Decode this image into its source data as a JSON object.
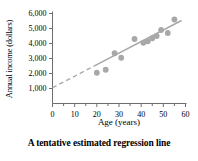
{
  "chart_data": {
    "type": "scatter",
    "title": "",
    "caption": "A tentative estimated regression line",
    "xlabel": "Age (years)",
    "ylabel": "Annual income (dollars)",
    "xlim": [
      0,
      60
    ],
    "ylim": [
      0,
      6000
    ],
    "xticks": [
      0,
      10,
      20,
      30,
      40,
      50,
      60
    ],
    "xtick_labels": [
      "0",
      "10",
      "20",
      "30",
      "40",
      "50",
      "60"
    ],
    "x_minor_tick_step": 5,
    "yticks": [
      1000,
      2000,
      3000,
      4000,
      5000,
      6000
    ],
    "ytick_labels": [
      "1,000",
      "2,000",
      "3,000",
      "4,000",
      "5,000",
      "6,000"
    ],
    "grid": false,
    "legend": null,
    "point_color": "#a8a8a8",
    "line_color": "#a8a8a8",
    "axis_color": "#6e6e6e",
    "points": [
      {
        "x": 20,
        "y": 2050
      },
      {
        "x": 24,
        "y": 2250
      },
      {
        "x": 28,
        "y": 3350
      },
      {
        "x": 31,
        "y": 3050
      },
      {
        "x": 37,
        "y": 4300
      },
      {
        "x": 41,
        "y": 4050
      },
      {
        "x": 43,
        "y": 4150
      },
      {
        "x": 45,
        "y": 4350
      },
      {
        "x": 47,
        "y": 4500
      },
      {
        "x": 49,
        "y": 4900
      },
      {
        "x": 52,
        "y": 4700
      },
      {
        "x": 55,
        "y": 5600
      }
    ],
    "regression_line": {
      "intercept": 1050,
      "slope": 77,
      "x_start": 0,
      "x_end": 58,
      "dashed_from_x": 0,
      "dashed_to_x": 20,
      "solid_from_x": 20,
      "solid_to_x": 58
    }
  }
}
